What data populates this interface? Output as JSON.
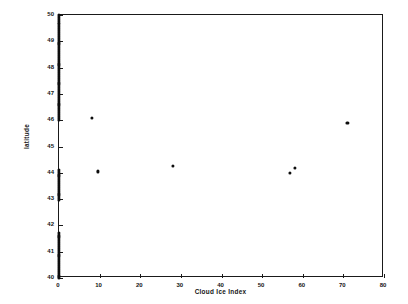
{
  "chart_data": {
    "type": "scatter",
    "title": "Transect along 80-81 West, 20-04-98, 22:24 GMT",
    "xlabel": "Cloud Ice Index",
    "ylabel": "latitude",
    "xlim": [
      0,
      80
    ],
    "ylim": [
      40,
      50
    ],
    "xticks": [
      0,
      10,
      20,
      30,
      40,
      50,
      60,
      70,
      80
    ],
    "xtick_labels": [
      "0",
      "10",
      "20",
      "30",
      "40",
      "50",
      "60",
      "70",
      "80"
    ],
    "yticks": [
      40,
      41,
      42,
      43,
      44,
      45,
      46,
      47,
      48,
      49,
      50
    ],
    "ytick_labels": [
      "40",
      "41",
      "42",
      "43",
      "44",
      "45",
      "46",
      "47",
      "48",
      "49",
      "50"
    ],
    "grid": false,
    "legend": null,
    "marker_color": "#0d0d0d",
    "series": [
      {
        "name": "zero-index transect points",
        "marker": "filled-circle",
        "points": [
          [
            0,
            50.0
          ],
          [
            0,
            49.92
          ],
          [
            0,
            49.84
          ],
          [
            0,
            49.76
          ],
          [
            0,
            49.68
          ],
          [
            0,
            49.6
          ],
          [
            0,
            49.52
          ],
          [
            0,
            49.44
          ],
          [
            0,
            49.36
          ],
          [
            0,
            49.28
          ],
          [
            0,
            49.2
          ],
          [
            0,
            49.12
          ],
          [
            0,
            49.04
          ],
          [
            0,
            48.96
          ],
          [
            0,
            48.88
          ],
          [
            0,
            48.8
          ],
          [
            0,
            48.72
          ],
          [
            0,
            48.64
          ],
          [
            0,
            48.56
          ],
          [
            0,
            48.48
          ],
          [
            0,
            48.4
          ],
          [
            0,
            48.32
          ],
          [
            0,
            48.24
          ],
          [
            0,
            48.16
          ],
          [
            0,
            48.08
          ],
          [
            0,
            48.0
          ],
          [
            0,
            47.92
          ],
          [
            0,
            47.84
          ],
          [
            0,
            47.76
          ],
          [
            0,
            47.68
          ],
          [
            0,
            47.6
          ],
          [
            0,
            47.52
          ],
          [
            0,
            47.44
          ],
          [
            0,
            47.36
          ],
          [
            0,
            47.28
          ],
          [
            0,
            47.2
          ],
          [
            0,
            47.12
          ],
          [
            0,
            47.04
          ],
          [
            0,
            46.96
          ],
          [
            0,
            46.88
          ],
          [
            0,
            46.8
          ],
          [
            0,
            46.72
          ],
          [
            0,
            46.64
          ],
          [
            0,
            46.56
          ],
          [
            0,
            46.48
          ],
          [
            0,
            46.4
          ],
          [
            0,
            46.32
          ],
          [
            0,
            46.24
          ],
          [
            0,
            46.16
          ],
          [
            0,
            46.08
          ],
          [
            0,
            46.0
          ],
          [
            0,
            44.1
          ],
          [
            0,
            44.02
          ],
          [
            0,
            43.94
          ],
          [
            0,
            43.86
          ],
          [
            0,
            43.78
          ],
          [
            0,
            43.7
          ],
          [
            0,
            43.62
          ],
          [
            0,
            43.54
          ],
          [
            0,
            43.46
          ],
          [
            0,
            43.38
          ],
          [
            0,
            43.3
          ],
          [
            0,
            43.22
          ],
          [
            0,
            43.14
          ],
          [
            0,
            43.06
          ],
          [
            0,
            42.98
          ],
          [
            0,
            41.7
          ],
          [
            0,
            41.62
          ],
          [
            0,
            41.54
          ],
          [
            0,
            41.46
          ],
          [
            0,
            41.38
          ],
          [
            0,
            41.3
          ],
          [
            0,
            41.22
          ],
          [
            0,
            41.14
          ],
          [
            0,
            41.06
          ],
          [
            0,
            40.98
          ],
          [
            0,
            40.9
          ],
          [
            0,
            40.82
          ],
          [
            0,
            40.74
          ],
          [
            0,
            40.66
          ],
          [
            0,
            40.58
          ],
          [
            0,
            40.5
          ],
          [
            0,
            40.42
          ],
          [
            0,
            40.34
          ],
          [
            0,
            40.26
          ],
          [
            0,
            40.18
          ],
          [
            0,
            40.1
          ],
          [
            0,
            40.02
          ]
        ]
      },
      {
        "name": "cloud ice observations",
        "marker": "circle",
        "points": [
          [
            8,
            46.1
          ],
          [
            9.5,
            44.05
          ],
          [
            28,
            44.25
          ],
          [
            56.8,
            44.0
          ],
          [
            58,
            44.18
          ],
          [
            71,
            45.9
          ]
        ]
      }
    ]
  }
}
